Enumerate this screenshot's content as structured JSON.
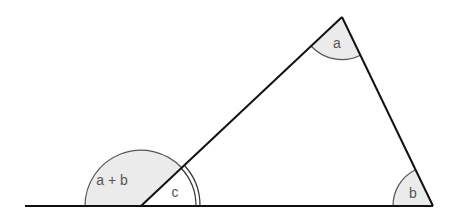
{
  "diagram": {
    "labels": {
      "angle_top": "a",
      "angle_right": "b",
      "angle_interior_left": "c",
      "angle_exterior": "a + b"
    },
    "colors": {
      "line": "#111111",
      "arc": "#555555",
      "fill": "#ebebeb",
      "label": "#555555"
    },
    "points": {
      "baseline_start": [
        25,
        206
      ],
      "vertex_c": [
        141,
        206
      ],
      "vertex_a": [
        342,
        17
      ],
      "vertex_b": [
        433,
        206
      ]
    }
  }
}
